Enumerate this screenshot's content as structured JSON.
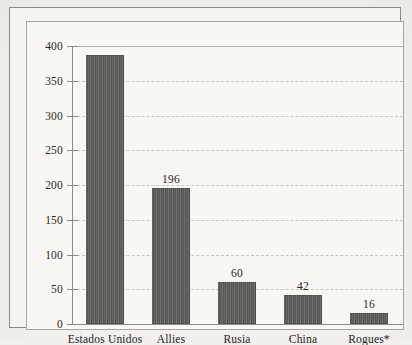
{
  "chart_data": {
    "type": "bar",
    "title": "",
    "xlabel": "",
    "ylabel": "",
    "categories": [
      "Estados Unidos",
      "Allies",
      "Rusia",
      "China",
      "Rogues*"
    ],
    "values": [
      387,
      196,
      60,
      42,
      16
    ],
    "value_labels": [
      "",
      "196",
      "60",
      "42",
      "16"
    ],
    "ylim": [
      0,
      400
    ],
    "yticks": [
      0,
      50,
      100,
      150,
      200,
      250,
      300,
      350,
      400
    ],
    "ytick_labels": [
      "0",
      "50",
      "100",
      "150",
      "200",
      "250",
      "300",
      "350",
      "400"
    ],
    "grid": true,
    "grid_style": "dashed",
    "legend": false,
    "bar_color": "#5d5b58",
    "background_color": "#f6f4f1",
    "grid_color": "#c9c6c1",
    "axis_color": "#8f8c87",
    "text_color": "#24231f"
  }
}
